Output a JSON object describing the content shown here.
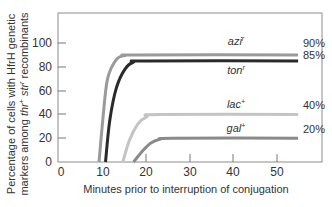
{
  "chart_data": {
    "type": "line",
    "title": "",
    "xlabel": "Minutes prior to interruption of conjugation",
    "ylabel_line1": "Percentage of cells with HfrH genetic",
    "ylabel_line2_prefix": "markers among ",
    "ylabel_line2_marker": "thr",
    "ylabel_line2_marker_sup": "+",
    "ylabel_line2_mid": " str",
    "ylabel_line2_mid_sup": "r",
    "ylabel_line2_suffix": " recombinants",
    "xlim": [
      0,
      60
    ],
    "ylim": [
      0,
      120
    ],
    "x_ticks": [
      0,
      10,
      20,
      30,
      40,
      50
    ],
    "x_tick_labels": [
      "0",
      "10",
      "20",
      "30",
      "40",
      "50"
    ],
    "y_ticks": [
      0,
      20,
      40,
      60,
      80,
      100
    ],
    "y_tick_labels": [
      "0",
      "20",
      "40",
      "60",
      "80",
      "100"
    ],
    "grid": false,
    "legend": "inline labels at curve plateaus",
    "series": [
      {
        "name": "azi",
        "superscript": "r",
        "entry_time_min": 9,
        "plateau_pct": 90,
        "end_min": 55,
        "end_label": "90%",
        "color": "#9a9a9a",
        "points": [
          [
            9,
            0
          ],
          [
            10,
            40
          ],
          [
            11,
            70
          ],
          [
            13,
            86
          ],
          [
            15,
            89.5
          ],
          [
            18,
            90
          ],
          [
            55,
            90
          ]
        ]
      },
      {
        "name": "ton",
        "superscript": "r",
        "entry_time_min": 11,
        "plateau_pct": 85,
        "end_min": 55,
        "end_label": "85%",
        "color": "#2a2a2a",
        "points": [
          [
            10.5,
            0
          ],
          [
            11.5,
            35
          ],
          [
            13,
            62
          ],
          [
            15,
            78
          ],
          [
            17,
            84
          ],
          [
            20,
            85
          ],
          [
            55,
            85
          ]
        ]
      },
      {
        "name": "lac",
        "superscript": "+",
        "entry_time_min": 15,
        "plateau_pct": 40,
        "end_min": 55,
        "end_label": "40%",
        "color": "#c4c4c4",
        "points": [
          [
            14.5,
            0
          ],
          [
            16,
            18
          ],
          [
            18,
            32
          ],
          [
            20,
            38
          ],
          [
            23,
            40
          ],
          [
            55,
            40
          ]
        ]
      },
      {
        "name": "gal",
        "superscript": "+",
        "entry_time_min": 18,
        "plateau_pct": 20,
        "end_min": 55,
        "end_label": "20%",
        "color": "#8a8a8a",
        "points": [
          [
            17,
            0
          ],
          [
            19,
            9
          ],
          [
            21,
            16
          ],
          [
            23,
            19
          ],
          [
            26,
            20
          ],
          [
            55,
            20
          ]
        ]
      }
    ]
  },
  "labels": {
    "azi": {
      "name": "azi",
      "sup": "r",
      "pct": "90%"
    },
    "ton": {
      "name": "ton",
      "sup": "r",
      "pct": "85%"
    },
    "lac": {
      "name": "lac",
      "sup": "+",
      "pct": "40%"
    },
    "gal": {
      "name": "gal",
      "sup": "+",
      "pct": "20%"
    }
  }
}
